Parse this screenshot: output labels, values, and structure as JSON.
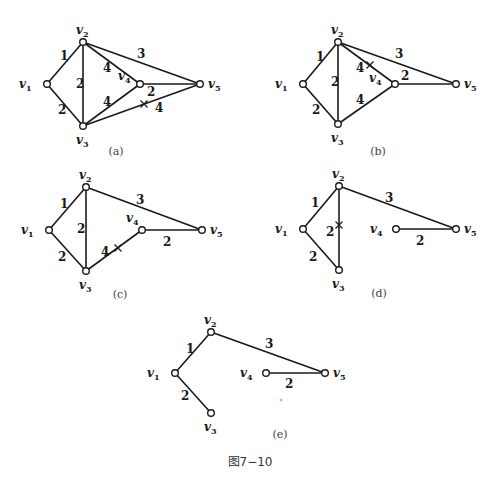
{
  "figure_title": "图7−10",
  "node_labels": {
    "v1": "v",
    "v2": "v",
    "v3": "v",
    "v4": "v",
    "v5": "v"
  },
  "subfigures": [
    {
      "id": "a",
      "caption": "(a)",
      "nodes": {
        "v1": [
          47,
          84
        ],
        "v2": [
          83,
          42
        ],
        "v3": [
          83,
          126
        ],
        "v4": [
          140,
          84
        ],
        "v5": [
          200,
          84
        ]
      },
      "edges": [
        {
          "from": "v1",
          "to": "v2",
          "weight": "1",
          "label_pos": [
            60,
            60
          ]
        },
        {
          "from": "v1",
          "to": "v3",
          "weight": "2",
          "label_pos": [
            58,
            114
          ]
        },
        {
          "from": "v2",
          "to": "v3",
          "weight": "2",
          "label_pos": [
            76,
            88
          ]
        },
        {
          "from": "v2",
          "to": "v4",
          "weight": "4",
          "label_pos": [
            103,
            72
          ]
        },
        {
          "from": "v3",
          "to": "v4",
          "weight": "4",
          "label_pos": [
            103,
            106
          ]
        },
        {
          "from": "v2",
          "to": "v5",
          "weight": "3",
          "label_pos": [
            137,
            58
          ]
        },
        {
          "from": "v4",
          "to": "v5",
          "weight": "2",
          "label_pos": [
            147,
            96
          ]
        },
        {
          "from": "v3",
          "to": "v5",
          "weight": "4",
          "label_pos": [
            155,
            112
          ],
          "crossed": true,
          "cross_pos": [
            144,
            104
          ]
        }
      ]
    },
    {
      "id": "b",
      "caption": "(b)",
      "nodes": {
        "v1": [
          303,
          84
        ],
        "v2": [
          338,
          42
        ],
        "v3": [
          338,
          124
        ],
        "v4": [
          395,
          84
        ],
        "v5": [
          456,
          84
        ]
      },
      "edges": [
        {
          "from": "v1",
          "to": "v2",
          "weight": "1",
          "label_pos": [
            316,
            61
          ]
        },
        {
          "from": "v1",
          "to": "v3",
          "weight": "2",
          "label_pos": [
            312,
            114
          ]
        },
        {
          "from": "v2",
          "to": "v3",
          "weight": "2",
          "label_pos": [
            331,
            86
          ]
        },
        {
          "from": "v2",
          "to": "v4",
          "weight": "4",
          "label_pos": [
            356,
            72
          ],
          "crossed": true,
          "cross_pos": [
            370,
            65
          ]
        },
        {
          "from": "v3",
          "to": "v4",
          "weight": "4",
          "label_pos": [
            356,
            104
          ]
        },
        {
          "from": "v2",
          "to": "v5",
          "weight": "3",
          "label_pos": [
            395,
            58
          ]
        },
        {
          "from": "v4",
          "to": "v5",
          "weight": "2",
          "label_pos": [
            401,
            80
          ]
        }
      ]
    },
    {
      "id": "c",
      "caption": "(c)",
      "nodes": {
        "v1": [
          49,
          230
        ],
        "v2": [
          86,
          187
        ],
        "v3": [
          86,
          271
        ],
        "v4": [
          142,
          230
        ],
        "v5": [
          202,
          230
        ]
      },
      "edges": [
        {
          "from": "v1",
          "to": "v2",
          "weight": "1",
          "label_pos": [
            60,
            208
          ]
        },
        {
          "from": "v1",
          "to": "v3",
          "weight": "2",
          "label_pos": [
            58,
            261
          ]
        },
        {
          "from": "v2",
          "to": "v3",
          "weight": "2",
          "label_pos": [
            77,
            233
          ]
        },
        {
          "from": "v3",
          "to": "v4",
          "weight": "4",
          "label_pos": [
            101,
            256
          ],
          "crossed": true,
          "cross_pos": [
            118,
            248
          ]
        },
        {
          "from": "v2",
          "to": "v5",
          "weight": "3",
          "label_pos": [
            136,
            204
          ]
        },
        {
          "from": "v4",
          "to": "v5",
          "weight": "2",
          "label_pos": [
            163,
            246
          ]
        }
      ]
    },
    {
      "id": "d",
      "caption": "(d)",
      "nodes": {
        "v1": [
          303,
          229
        ],
        "v2": [
          339,
          186
        ],
        "v3": [
          339,
          270
        ],
        "v4": [
          396,
          229
        ],
        "v5": [
          456,
          229
        ]
      },
      "edges": [
        {
          "from": "v1",
          "to": "v2",
          "weight": "1",
          "label_pos": [
            311,
            207
          ]
        },
        {
          "from": "v1",
          "to": "v3",
          "weight": "2",
          "label_pos": [
            309,
            261
          ]
        },
        {
          "from": "v2",
          "to": "v3",
          "weight": "2",
          "label_pos": [
            326,
            236
          ],
          "crossed": true,
          "cross_pos": [
            339,
            225
          ]
        },
        {
          "from": "v2",
          "to": "v5",
          "weight": "3",
          "label_pos": [
            385,
            202
          ]
        },
        {
          "from": "v4",
          "to": "v5",
          "weight": "2",
          "label_pos": [
            416,
            245
          ]
        }
      ]
    },
    {
      "id": "e",
      "caption": "(e)",
      "nodes": {
        "v1": [
          175,
          373
        ],
        "v2": [
          211,
          332
        ],
        "v3": [
          211,
          413
        ],
        "v4": [
          266,
          373
        ],
        "v5": [
          325,
          373
        ]
      },
      "edges": [
        {
          "from": "v1",
          "to": "v2",
          "weight": "1",
          "label_pos": [
            186,
            353
          ]
        },
        {
          "from": "v1",
          "to": "v3",
          "weight": "2",
          "label_pos": [
            181,
            400
          ]
        },
        {
          "from": "v2",
          "to": "v5",
          "weight": "3",
          "label_pos": [
            265,
            348
          ]
        },
        {
          "from": "v4",
          "to": "v5",
          "weight": "2",
          "label_pos": [
            285,
            388
          ]
        }
      ]
    }
  ],
  "label_offsets": {
    "a": {
      "v1": [
        -28,
        4
      ],
      "v2": [
        -7,
        -8
      ],
      "v3": [
        -7,
        18
      ],
      "v4": [
        -22,
        -4
      ],
      "v5": [
        8,
        4
      ]
    },
    "b": {
      "v1": [
        -28,
        4
      ],
      "v2": [
        -7,
        -8
      ],
      "v3": [
        -7,
        18
      ],
      "v4": [
        -26,
        -2
      ],
      "v5": [
        8,
        4
      ]
    },
    "c": {
      "v1": [
        -28,
        4
      ],
      "v2": [
        -7,
        -8
      ],
      "v3": [
        -7,
        18
      ],
      "v4": [
        -16,
        -8
      ],
      "v5": [
        8,
        4
      ]
    },
    "d": {
      "v1": [
        -28,
        4
      ],
      "v2": [
        -7,
        -8
      ],
      "v3": [
        -7,
        18
      ],
      "v4": [
        -26,
        4
      ],
      "v5": [
        8,
        4
      ]
    },
    "e": {
      "v1": [
        -28,
        4
      ],
      "v2": [
        -7,
        -8
      ],
      "v3": [
        -7,
        18
      ],
      "v4": [
        -26,
        4
      ],
      "v5": [
        8,
        4
      ]
    }
  },
  "caption_pos": {
    "a": [
      116,
      155
    ],
    "b": [
      378,
      155
    ],
    "c": [
      120,
      298
    ],
    "d": [
      379,
      297
    ],
    "e": [
      280,
      438
    ]
  },
  "title_pos": [
    250,
    466
  ]
}
